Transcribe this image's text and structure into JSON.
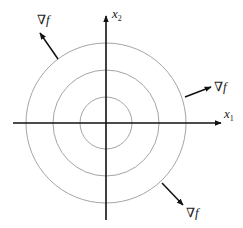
{
  "diagram": {
    "type": "gradient-of-contour-circles",
    "center": [
      106,
      123
    ],
    "axes": {
      "x1": {
        "label": "x",
        "subscript": "1",
        "from": [
          13,
          123
        ],
        "to": [
          221,
          123
        ]
      },
      "x2": {
        "label": "x",
        "subscript": "2",
        "from": [
          106,
          220
        ],
        "to": [
          106,
          16
        ]
      }
    },
    "contours": [
      {
        "r": 26
      },
      {
        "r": 53
      },
      {
        "r": 80
      }
    ],
    "gradient_vectors": [
      {
        "name": "upper-left",
        "label": "∇f",
        "from": [
          58,
          59
        ],
        "to": [
          40,
          33
        ],
        "label_pos": [
          37,
          24
        ]
      },
      {
        "name": "right",
        "label": "∇f",
        "from": [
          185,
          97
        ],
        "to": [
          211,
          87
        ],
        "label_pos": [
          214,
          91
        ]
      },
      {
        "name": "lower-right",
        "label": "∇f",
        "from": [
          162,
          183
        ],
        "to": [
          183,
          205
        ],
        "label_pos": [
          186,
          217
        ]
      }
    ],
    "colors": {
      "axis": "#111111",
      "contour": "#9a9a9a",
      "arrow": "#111111",
      "text": "#222222"
    }
  }
}
